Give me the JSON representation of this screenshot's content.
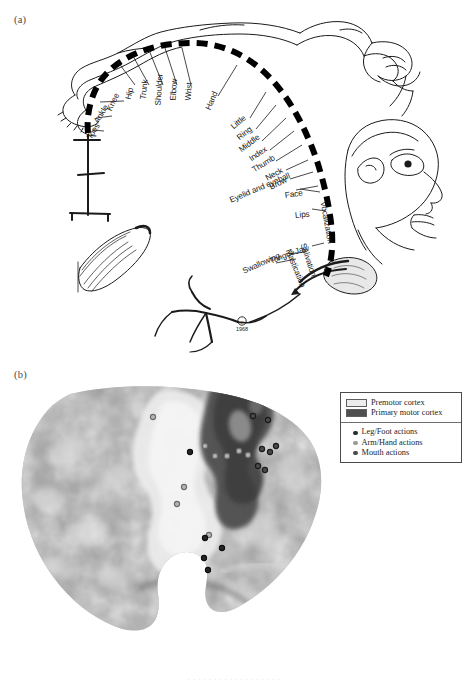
{
  "figure": {
    "panel_a_label": "(a)",
    "panel_b_label": "(b)",
    "copyright_year": "1968",
    "caption_remnant": "· · ·   ·   ·   ·    · ·   · ·      · · · · · ·   · ·"
  },
  "homunculus": {
    "title": "Motor homunculus",
    "labels": [
      {
        "text": "Toes",
        "x": 89,
        "y": 134,
        "angle": -58
      },
      {
        "text": "Ankle",
        "x": 96,
        "y": 118,
        "angle": -58
      },
      {
        "text": "Knee",
        "x": 109,
        "y": 106,
        "angle": -64
      },
      {
        "text": "Hip",
        "x": 128,
        "y": 95,
        "angle": -76
      },
      {
        "text": "Trunk",
        "x": 143,
        "y": 95,
        "angle": -84
      },
      {
        "text": "Shoulder",
        "x": 158,
        "y": 101,
        "angle": -86
      },
      {
        "text": "Elbow",
        "x": 173,
        "y": 96,
        "angle": -86
      },
      {
        "text": "Wrist",
        "x": 188,
        "y": 96,
        "angle": -85
      },
      {
        "text": "Hand",
        "x": 208,
        "y": 105,
        "angle": -67
      },
      {
        "text": "Little",
        "x": 232,
        "y": 123,
        "angle": -39
      },
      {
        "text": "Ring",
        "x": 238,
        "y": 134,
        "angle": -39
      },
      {
        "text": "Middle",
        "x": 240,
        "y": 146,
        "angle": -37
      },
      {
        "text": "Index",
        "x": 250,
        "y": 155,
        "angle": -35
      },
      {
        "text": "Thumb",
        "x": 253,
        "y": 166,
        "angle": -32
      },
      {
        "text": "Neck",
        "x": 266,
        "y": 174,
        "angle": -28
      },
      {
        "text": "Brow",
        "x": 270,
        "y": 183,
        "angle": -26
      },
      {
        "text": "Eyelid and eyeball",
        "x": 230,
        "y": 196,
        "angle": -23
      },
      {
        "text": "Face",
        "x": 285,
        "y": 191,
        "angle": -8
      },
      {
        "text": "Lips",
        "x": 295,
        "y": 211,
        "angle": -6
      },
      {
        "text": "Vocalization",
        "x": 323,
        "y": 197,
        "angle": 80
      },
      {
        "text": "Jaw",
        "x": 295,
        "y": 247,
        "angle": -14
      },
      {
        "text": "Tongue",
        "x": 270,
        "y": 257,
        "angle": -22
      },
      {
        "text": "Swallowing",
        "x": 243,
        "y": 267,
        "angle": -24
      },
      {
        "text": "Salivation",
        "x": 303,
        "y": 239,
        "angle": 72
      },
      {
        "text": "Mastication",
        "x": 288,
        "y": 245,
        "angle": 68
      }
    ]
  },
  "brain": {
    "title": "Inflated lateral cortical surface",
    "regions": [
      {
        "name": "Premotor cortex",
        "shade": "#e6e6e6"
      },
      {
        "name": "Primary motor cortex",
        "shade": "#555555"
      }
    ],
    "activation_points": [
      {
        "group": "arm-hand",
        "x": 153,
        "y": 417
      },
      {
        "group": "arm-hand",
        "x": 205,
        "y": 446
      },
      {
        "group": "leg-foot",
        "x": 190,
        "y": 452
      },
      {
        "group": "arm-hand",
        "x": 215,
        "y": 456
      },
      {
        "group": "arm-hand",
        "x": 227,
        "y": 456
      },
      {
        "group": "arm-hand",
        "x": 239,
        "y": 451
      },
      {
        "group": "arm-hand",
        "x": 248,
        "y": 455
      },
      {
        "group": "arm-hand",
        "x": 184,
        "y": 487
      },
      {
        "group": "arm-hand",
        "x": 177,
        "y": 504
      },
      {
        "group": "arm-hand",
        "x": 209,
        "y": 535
      },
      {
        "group": "leg-foot",
        "x": 205,
        "y": 538
      },
      {
        "group": "leg-foot",
        "x": 222,
        "y": 548
      },
      {
        "group": "leg-foot",
        "x": 204,
        "y": 558
      },
      {
        "group": "leg-foot",
        "x": 208,
        "y": 570
      },
      {
        "group": "mouth",
        "x": 253,
        "y": 416
      },
      {
        "group": "mouth",
        "x": 268,
        "y": 420
      },
      {
        "group": "mouth",
        "x": 262,
        "y": 449
      },
      {
        "group": "mouth",
        "x": 270,
        "y": 452
      },
      {
        "group": "mouth",
        "x": 258,
        "y": 466
      },
      {
        "group": "mouth",
        "x": 265,
        "y": 470
      },
      {
        "group": "mouth",
        "x": 276,
        "y": 446
      }
    ]
  },
  "legend": {
    "regions": [
      {
        "label": "Premotor cortex",
        "swatch": "#ececec"
      },
      {
        "label": "Primary motor cortex",
        "swatch": "#4f4f4f"
      }
    ],
    "points": [
      {
        "label": "Leg/Foot actions",
        "color": "#2b2b2b"
      },
      {
        "label": "Arm/Hand actions",
        "color": "#9a9a9a"
      },
      {
        "label": "Mouth actions",
        "color": "#4a4a4a"
      }
    ]
  }
}
